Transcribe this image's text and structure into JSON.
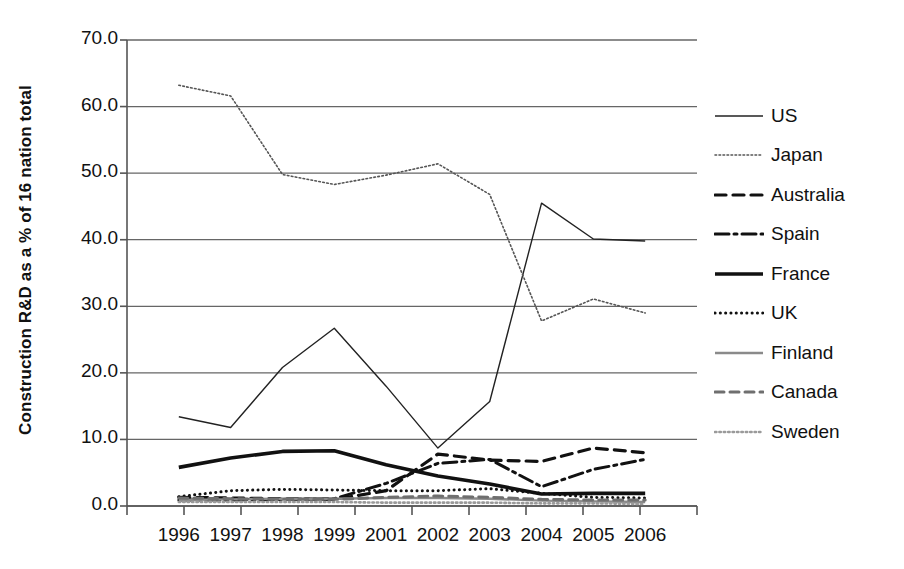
{
  "chart_data": {
    "type": "line",
    "title": "",
    "xlabel": "",
    "ylabel": "Construction R&D as a % of 16 nation total",
    "categories": [
      "1996",
      "1997",
      "1998",
      "1999",
      "2001",
      "2002",
      "2003",
      "2004",
      "2005",
      "2006"
    ],
    "ylim": [
      0.0,
      70.0
    ],
    "yticks": [
      "0.0",
      "10.0",
      "20.0",
      "30.0",
      "40.0",
      "50.0",
      "60.0",
      "70.0"
    ],
    "ytick_values": [
      0.0,
      10.0,
      20.0,
      30.0,
      40.0,
      50.0,
      60.0,
      70.0
    ],
    "grid": "horizontal",
    "legend_position": "right",
    "series": [
      {
        "name": "US",
        "style": "solid-thin",
        "color": "#222222",
        "width": 1.4,
        "dash": "none",
        "values": [
          13.4,
          11.8,
          20.8,
          26.7,
          18.0,
          8.7,
          15.7,
          45.5,
          40.1,
          39.8
        ]
      },
      {
        "name": "Japan",
        "style": "fine-dotted",
        "color": "#555555",
        "width": 1.6,
        "dash": "1.6,2.4",
        "values": [
          63.2,
          61.6,
          49.8,
          48.3,
          49.7,
          51.4,
          46.8,
          27.8,
          31.1,
          29.0
        ]
      },
      {
        "name": "Australia",
        "style": "dashed",
        "color": "#111111",
        "width": 3.2,
        "dash": "11,7",
        "values": [
          1.3,
          1.2,
          1.1,
          1.0,
          2.3,
          7.8,
          6.9,
          6.7,
          8.7,
          8.0
        ]
      },
      {
        "name": "Spain",
        "style": "dash-dot",
        "color": "#111111",
        "width": 3.0,
        "dash": "14,5,3,5",
        "values": [
          0.9,
          0.9,
          1.0,
          1.1,
          3.4,
          6.4,
          7.0,
          2.9,
          5.5,
          7.0
        ]
      },
      {
        "name": "France",
        "style": "solid-thick",
        "color": "#111111",
        "width": 3.6,
        "dash": "none",
        "values": [
          5.8,
          7.2,
          8.2,
          8.3,
          6.2,
          4.5,
          3.3,
          1.8,
          1.9,
          1.9
        ]
      },
      {
        "name": "UK",
        "style": "dotted",
        "color": "#111111",
        "width": 3.0,
        "dash": "0.1,5.2",
        "values": [
          1.4,
          2.3,
          2.5,
          2.4,
          2.3,
          2.3,
          2.6,
          1.9,
          1.3,
          1.2
        ]
      },
      {
        "name": "Finland",
        "style": "solid-medium-gray",
        "color": "#8a8a8a",
        "width": 2.4,
        "dash": "none",
        "values": [
          0.9,
          1.0,
          1.1,
          1.1,
          1.2,
          1.2,
          1.1,
          0.8,
          0.7,
          0.6
        ]
      },
      {
        "name": "Canada",
        "style": "gray-dashed",
        "color": "#6f6f6f",
        "width": 3.0,
        "dash": "9,6",
        "values": [
          1.2,
          1.1,
          1.0,
          1.0,
          1.3,
          1.5,
          1.3,
          1.0,
          0.9,
          0.9
        ]
      },
      {
        "name": "Sweden",
        "style": "gray-fine-dotted",
        "color": "#9a9a9a",
        "width": 2.6,
        "dash": "1.4,3.0",
        "values": [
          0.6,
          0.6,
          0.6,
          0.6,
          0.5,
          0.5,
          0.5,
          0.4,
          0.4,
          0.3
        ]
      }
    ]
  },
  "axes": {
    "axis_color": "#555555",
    "grid_color": "#666666"
  }
}
